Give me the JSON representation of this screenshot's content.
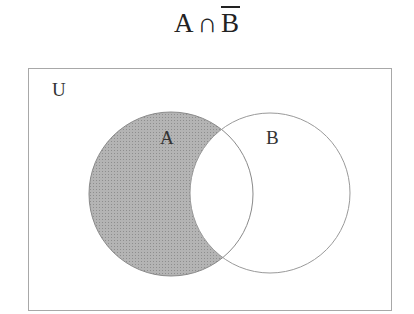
{
  "title": {
    "set_a": "A",
    "operator": "∩",
    "set_b_complement": "B",
    "full_expression": "A ∩ B̄"
  },
  "diagram": {
    "universe_label": "U",
    "sets": [
      {
        "label": "A",
        "shaded": "only-A (excluding intersection with B)"
      },
      {
        "label": "B",
        "shaded": "none"
      }
    ],
    "shaded_region": "A ∩ B̄",
    "colors": {
      "shade": "#a9a9a9",
      "outline": "#9a9a9a",
      "background": "#ffffff"
    }
  }
}
